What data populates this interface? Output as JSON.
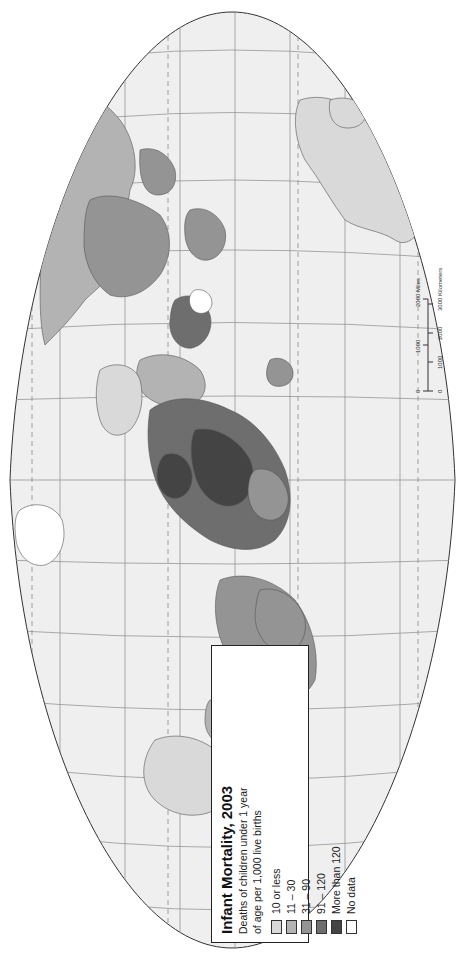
{
  "map": {
    "title": "Infant Mortality, 2003",
    "subtitle_line1": "Deaths of children under 1 year",
    "subtitle_line2": "of age per 1,000 live births",
    "orientation": "rotated 90° counter-clockwise",
    "projection_shape": "oval world projection with graticule (dashed tropics/polar circles)",
    "colors": {
      "background": "#ffffff",
      "ocean": "#efefef",
      "graticule": "#8a8a8a",
      "border": "#555555"
    }
  },
  "legend": {
    "items": [
      {
        "label": "10 or less",
        "color": "#d9d9d9"
      },
      {
        "label": "11 – 30",
        "color": "#b3b3b3"
      },
      {
        "label": "31 – 90",
        "color": "#949494"
      },
      {
        "label": "91 – 120",
        "color": "#6e6e6e"
      },
      {
        "label": "More than 120",
        "color": "#444444"
      },
      {
        "label": "No data",
        "color": "#ffffff"
      }
    ]
  },
  "scale_bar": {
    "miles_ticks": [
      "0",
      "1000",
      "2000 Miles"
    ],
    "km_ticks": [
      "0",
      "1000",
      "2000",
      "3000 Kilometers"
    ]
  }
}
